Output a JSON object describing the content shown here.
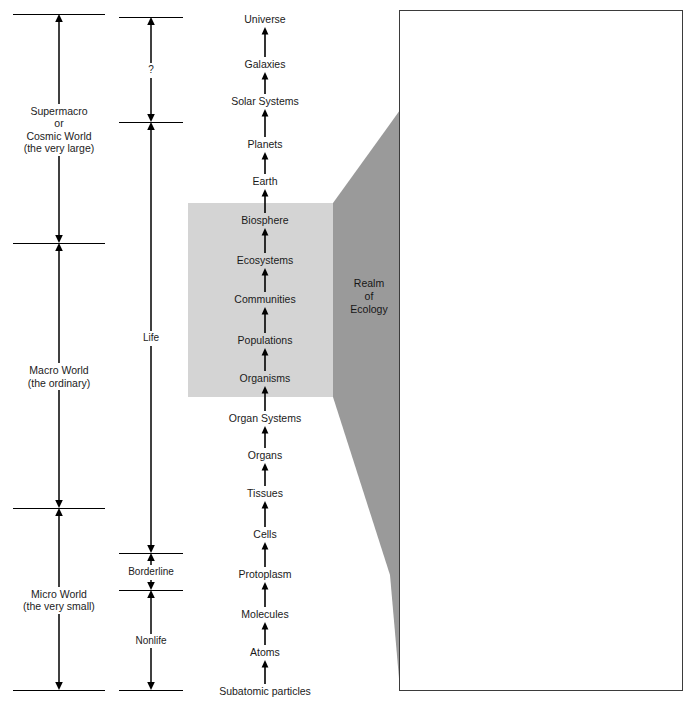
{
  "scale_column": {
    "name": "size-scale",
    "segments": [
      {
        "label": "Supermacro\nor\nCosmic World\n(the very large)",
        "top": 14,
        "bottom": 243
      },
      {
        "label": "Macro World\n(the ordinary)",
        "top": 243,
        "bottom": 508
      },
      {
        "label": "Micro World\n(the very small)",
        "top": 508,
        "bottom": 690
      }
    ]
  },
  "life_column": {
    "name": "life-scale",
    "segments": [
      {
        "label": "?",
        "top": 17,
        "bottom": 122
      },
      {
        "label": "Life",
        "top": 122,
        "bottom": 553
      },
      {
        "label": "Borderline",
        "top": 553,
        "bottom": 590
      },
      {
        "label": "Nonlife",
        "top": 590,
        "bottom": 690
      }
    ]
  },
  "hierarchy": {
    "name": "organization-ladder",
    "note": "read from top (largest) to bottom (smallest); arrows point upward",
    "levels": [
      {
        "label": "Universe",
        "y": 20
      },
      {
        "label": "Galaxies",
        "y": 65
      },
      {
        "label": "Solar Systems",
        "y": 102
      },
      {
        "label": "Planets",
        "y": 145
      },
      {
        "label": "Earth",
        "y": 182
      },
      {
        "label": "Biosphere",
        "y": 221
      },
      {
        "label": "Ecosystems",
        "y": 261
      },
      {
        "label": "Communities",
        "y": 300
      },
      {
        "label": "Populations",
        "y": 341
      },
      {
        "label": "Organisms",
        "y": 379
      },
      {
        "label": "Organ Systems",
        "y": 419
      },
      {
        "label": "Organs",
        "y": 456
      },
      {
        "label": "Tissues",
        "y": 494
      },
      {
        "label": "Cells",
        "y": 535
      },
      {
        "label": "Protoplasm",
        "y": 575
      },
      {
        "label": "Molecules",
        "y": 615
      },
      {
        "label": "Atoms",
        "y": 653
      },
      {
        "label": "Subatomic particles",
        "y": 692
      }
    ]
  },
  "ecology_region": {
    "box_label": "Realm of Ecology shading",
    "wedge_label": "Realm\nof\nEcology",
    "covers": [
      "Biosphere",
      "Ecosystems",
      "Communities",
      "Populations",
      "Organisms"
    ],
    "box_color": "#d4d4d4",
    "wedge_color": "#9a9a9a"
  },
  "illustrations": {
    "name": "ecology-illustration-stack",
    "panels": [
      {
        "label": "Biosphere",
        "art": "earth-globe",
        "label_align": "center"
      },
      {
        "label": "Ecosystems",
        "art": "mountain-valley",
        "label_align": "right"
      },
      {
        "label": "Communities",
        "art": "prairie-with-rider",
        "label_align": "left"
      },
      {
        "label": "Populations",
        "art": "pronghorn-herd",
        "label_align": "right"
      },
      {
        "label": "Organisms",
        "art": "single-pronghorn",
        "label_align": "left"
      }
    ]
  }
}
